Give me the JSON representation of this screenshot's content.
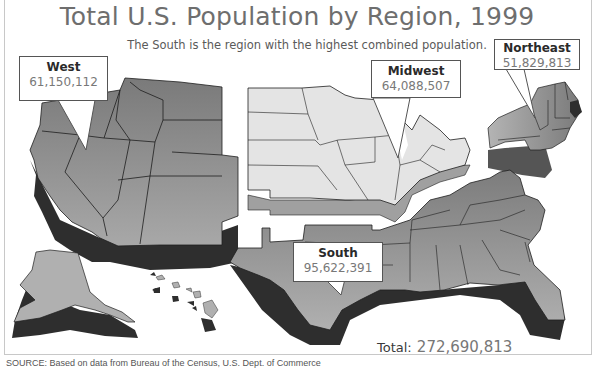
{
  "title": "Total U.S. Population by Region, 1999",
  "subtitle": "The South is the region with the highest combined population.",
  "regions": [
    {
      "name": "West",
      "population": "61,150,112",
      "shade": "#8e8e8e"
    },
    {
      "name": "Midwest",
      "population": "64,088,507",
      "shade": "#e4e4e4"
    },
    {
      "name": "Northeast",
      "population": "51,829,813",
      "shade": "#a2a2a2"
    },
    {
      "name": "South",
      "population": "95,622,391",
      "shade": "#9a9a9a"
    }
  ],
  "total": {
    "label": "Total:",
    "value": "272,690,813"
  },
  "source": "SOURCE: Based on data from Bureau of the Census, U.S. Dept. of Commerce",
  "colors": {
    "shadow": "#2e2e2e",
    "outline": "#1e1e1e",
    "title": "#6e6e6e"
  }
}
